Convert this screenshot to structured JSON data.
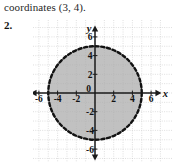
{
  "page": {
    "carryover_text": "coordinates (3, 4).",
    "problem_number": "2."
  },
  "chart_data": {
    "type": "scatter",
    "title": "",
    "xlabel": "x",
    "ylabel": "y",
    "xlim": [
      -7,
      7
    ],
    "ylim": [
      -7,
      7
    ],
    "grid": true,
    "grid_step": 1,
    "x_ticks": [
      -6,
      -4,
      -2,
      0,
      2,
      4,
      6
    ],
    "x_tick_labels": [
      "-6",
      "-4",
      "-2",
      "0",
      "2",
      "4",
      "6"
    ],
    "y_ticks": [
      6,
      4,
      2,
      -2,
      -4,
      -6
    ],
    "y_tick_labels": [
      "6",
      "4",
      "2",
      "-2",
      "-4",
      "-6"
    ],
    "origin_label": "0",
    "legend": [],
    "annotations": [],
    "shapes": [
      {
        "kind": "circle",
        "center_x": 0,
        "center_y": 0,
        "radius": 5,
        "boundary": "dashed",
        "fill": "#a9a9a9",
        "edge_color": "#121212",
        "region": "interior-shaded",
        "inequality": "x^2 + y^2 < 25"
      }
    ],
    "axis_arrows": [
      "left",
      "right",
      "up",
      "down"
    ],
    "colors": {
      "grid": "#c9c9c9",
      "axis": "#1a1a1a",
      "shade": "#a9a9a9",
      "boundary": "#121212",
      "background": "#ffffff"
    }
  }
}
